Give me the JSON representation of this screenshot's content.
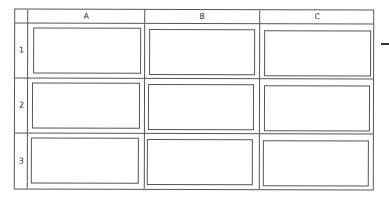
{
  "columns": [
    {
      "label": "A"
    },
    {
      "label": "B"
    },
    {
      "label": "C"
    }
  ],
  "rows": [
    {
      "label": "1"
    },
    {
      "label": "2"
    },
    {
      "label": "3"
    }
  ],
  "colors": {
    "line": "#555555",
    "background": "#ffffff"
  }
}
